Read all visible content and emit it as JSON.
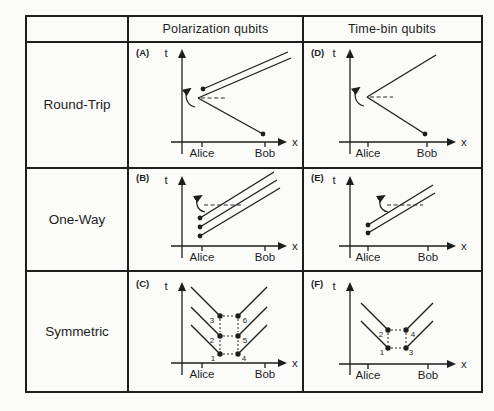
{
  "colors": {
    "ink": "#1e1e1e",
    "paper": "#fbfbfa"
  },
  "header": {
    "polarization_col": "Polarization qubits",
    "timebin_col": "Time-bin qubits"
  },
  "rows": {
    "round_trip": "Round-Trip",
    "one_way": "One-Way",
    "symmetric": "Symmetric"
  },
  "axes": {
    "t": "t",
    "x": "x",
    "alice": "Alice",
    "bob": "Bob"
  },
  "panels": {
    "a": {
      "tag": "(A)"
    },
    "b": {
      "tag": "(B)"
    },
    "c": {
      "tag": "(C)",
      "events": [
        "1",
        "2",
        "3",
        "4",
        "5",
        "6"
      ]
    },
    "d": {
      "tag": "(D)"
    },
    "e": {
      "tag": "(E)"
    },
    "f": {
      "tag": "(F)",
      "events": [
        "1",
        "2",
        "3",
        "4"
      ]
    }
  }
}
